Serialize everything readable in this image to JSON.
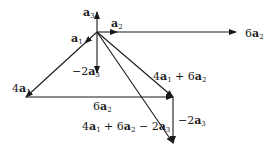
{
  "diagram": {
    "type": "vector-addition",
    "origin": [
      97,
      32
    ],
    "vectors": [
      {
        "id": "a3",
        "label": "a3",
        "from": [
          97,
          32
        ],
        "to": [
          97,
          12
        ]
      },
      {
        "id": "a2",
        "label": "a2",
        "from": [
          97,
          32
        ],
        "to": [
          117,
          32
        ]
      },
      {
        "id": "6a2_top",
        "label": "6a2",
        "from": [
          97,
          32
        ],
        "to": [
          236,
          32
        ]
      },
      {
        "id": "a1",
        "label": "a1",
        "from": [
          97,
          32
        ],
        "to": [
          85,
          43
        ]
      },
      {
        "id": "neg2a3_left",
        "label": "-2a3",
        "from": [
          97,
          32
        ],
        "to": [
          97,
          73
        ]
      },
      {
        "id": "4a1",
        "label": "4a1",
        "from": [
          97,
          32
        ],
        "to": [
          26,
          97
        ]
      },
      {
        "id": "6a2_bottom",
        "label": "6a2",
        "from": [
          26,
          97
        ],
        "to": [
          173,
          97
        ]
      },
      {
        "id": "4a1_plus_6a2",
        "label": "4a1 + 6a2",
        "from": [
          97,
          32
        ],
        "to": [
          173,
          97
        ]
      },
      {
        "id": "neg2a3_right",
        "label": "-2a3",
        "from": [
          173,
          97
        ],
        "to": [
          173,
          143
        ]
      },
      {
        "id": "sum",
        "label": "4a1 + 6a2 - 2a3",
        "from": [
          97,
          32
        ],
        "to": [
          173,
          143
        ]
      }
    ],
    "labels": {
      "a3": {
        "coef": "",
        "sub": "3"
      },
      "a2": {
        "coef": "",
        "sub": "2"
      },
      "six_a2_top": {
        "coef": "6",
        "sub": "2"
      },
      "a1": {
        "coef": "",
        "sub": "1"
      },
      "neg2a3_left": {
        "coef": "−2",
        "sub": "3"
      },
      "four_a1": {
        "coef": "4",
        "sub": "1"
      },
      "six_a2_bottom": {
        "coef": "6",
        "sub": "2"
      },
      "sum_4a1_6a2": {
        "t1": "4",
        "s1": "1",
        "op": " + ",
        "t2": "6",
        "s2": "2"
      },
      "neg2a3_right": {
        "coef": "−2",
        "sub": "3"
      },
      "sum_full": {
        "t1": "4",
        "s1": "1",
        "op1": " + ",
        "t2": "6",
        "s2": "2",
        "op2": " − ",
        "t3": "2",
        "s3": "3"
      }
    },
    "basis_symbol": "a",
    "stroke_color": "#1a1a1a"
  }
}
